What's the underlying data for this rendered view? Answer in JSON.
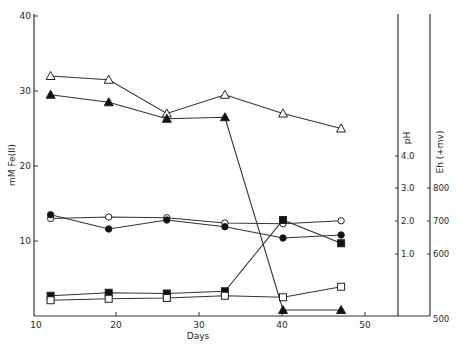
{
  "chart_data": {
    "type": "line",
    "title": "",
    "xlabel": "Days",
    "ylabel": "mM Fe(II)",
    "xlim": [
      10,
      50
    ],
    "ylim": [
      0,
      40
    ],
    "x_ticks": [
      10,
      20,
      30,
      40,
      50
    ],
    "y_ticks": [
      10,
      20,
      30,
      40
    ],
    "grid": false,
    "legend": "none",
    "x": [
      12,
      19,
      26,
      33,
      40,
      47
    ],
    "series": [
      {
        "name": "open triangle",
        "marker": "triangle-open",
        "axis": "Fe(II)",
        "values": [
          32.0,
          31.5,
          27.0,
          29.5,
          27.0,
          25.0
        ]
      },
      {
        "name": "filled triangle",
        "marker": "triangle-filled",
        "axis": "Fe(II)",
        "values": [
          29.5,
          28.5,
          26.3,
          26.5,
          0.8,
          0.8
        ]
      },
      {
        "name": "open circle",
        "marker": "circle-open",
        "axis": "Fe(II)",
        "values": [
          13.0,
          13.2,
          13.1,
          12.4,
          12.3,
          12.7
        ]
      },
      {
        "name": "filled circle",
        "marker": "circle-filled",
        "axis": "Fe(II)",
        "values": [
          13.5,
          11.6,
          12.8,
          11.9,
          10.4,
          10.8
        ]
      },
      {
        "name": "filled square",
        "marker": "square-filled",
        "axis": "Fe(II)",
        "values": [
          2.7,
          3.1,
          3.0,
          3.3,
          12.8,
          9.7
        ]
      },
      {
        "name": "open square",
        "marker": "square-open",
        "axis": "Fe(II)",
        "values": [
          2.1,
          2.3,
          2.4,
          2.7,
          2.5,
          3.9
        ]
      }
    ],
    "secondary_axes": [
      {
        "label": "pH",
        "ticks": [
          "1.0",
          "2.0",
          "3.0",
          "4.0"
        ]
      },
      {
        "label": "Eh (+mv)",
        "ticks": [
          "500",
          "600",
          "700",
          "800"
        ]
      }
    ]
  },
  "labels": {
    "xlabel": "Days",
    "ylabel": "mM Fe(II)",
    "ph_label": "pH",
    "eh_label": "Eh (+mv)",
    "x_ticks": [
      "10",
      "20",
      "30",
      "40",
      "50"
    ],
    "y_ticks": [
      "10",
      "20",
      "30",
      "40"
    ],
    "ph_ticks": [
      "1.0",
      "2.0",
      "3.0",
      "4.0"
    ],
    "eh_ticks": [
      "500",
      "600",
      "700",
      "800"
    ]
  }
}
